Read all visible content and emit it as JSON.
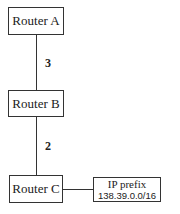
{
  "diagram": {
    "nodes": [
      {
        "id": "router-a",
        "label": "Router A"
      },
      {
        "id": "router-b",
        "label": "Router B"
      },
      {
        "id": "router-c",
        "label": "Router C"
      },
      {
        "id": "ip-prefix",
        "label": "IP prefix",
        "value": "138.39.0.0/16"
      }
    ],
    "edges": [
      {
        "from": "router-a",
        "to": "router-b",
        "cost": "3"
      },
      {
        "from": "router-b",
        "to": "router-c",
        "cost": "2"
      },
      {
        "from": "router-c",
        "to": "ip-prefix",
        "cost": ""
      }
    ]
  }
}
